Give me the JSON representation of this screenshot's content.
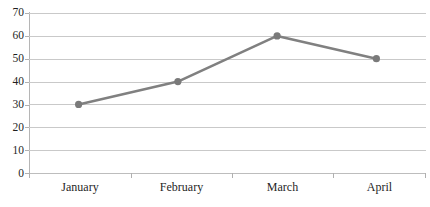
{
  "chart_data": {
    "type": "line",
    "title": "",
    "xlabel": "",
    "ylabel": "",
    "categories": [
      "January",
      "February",
      "March",
      "April"
    ],
    "values": [
      30,
      40,
      60,
      50
    ],
    "series": [
      {
        "name": "Series 1",
        "values": [
          30,
          40,
          60,
          50
        ]
      }
    ],
    "ylim": [
      0,
      70
    ],
    "y_ticks": [
      70,
      60,
      50,
      40,
      30,
      20,
      10,
      0
    ],
    "y_tick_labels": [
      "70",
      "60",
      "50",
      "40",
      "30",
      "20",
      "10",
      "0"
    ],
    "grid": "horizontal",
    "legend": "none",
    "line_color": "#808080",
    "marker_color": "#7a7a7a",
    "gridline_color": "#c9c9c9",
    "axis_color": "#b0b0b0",
    "background_color": "#ffffff",
    "marker_shape": "circle"
  },
  "chart": {
    "title_partial": "",
    "x_axis": {
      "name": "x-axis",
      "categories": [
        "January",
        "February",
        "March",
        "April"
      ]
    },
    "y_axis": {
      "name": "y-axis",
      "ticks": [
        "70",
        "60",
        "50",
        "40",
        "30",
        "20",
        "10",
        "0"
      ]
    },
    "points": [
      {
        "label": "January",
        "value": "30"
      },
      {
        "label": "February",
        "value": "40"
      },
      {
        "label": "March",
        "value": "60"
      },
      {
        "label": "April",
        "value": "50"
      }
    ]
  }
}
